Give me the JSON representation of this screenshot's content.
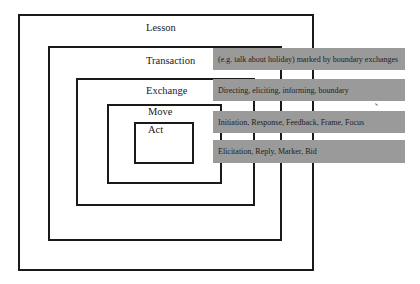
{
  "diagram": {
    "levels": [
      {
        "name": "Lesson"
      },
      {
        "name": "Transaction",
        "description": "(e.g. talk about holiday) marked by boundary exchanges"
      },
      {
        "name": "Exchange",
        "description": "Directing, eliciting, informing, boundary"
      },
      {
        "name": "Move",
        "description": "Initiation, Response, Feedback, Frame, Focus"
      },
      {
        "name": "Act",
        "description": "Elicitation, Reply, Marker, Bid"
      }
    ],
    "colors": {
      "box_border": "#1a1a1a",
      "bar_fill": "#9a9a9a",
      "background": "#ffffff"
    }
  }
}
